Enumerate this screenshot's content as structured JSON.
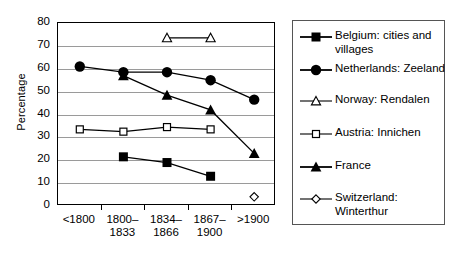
{
  "chart_data": {
    "type": "line",
    "title": "",
    "xlabel": "",
    "ylabel": "Percentage",
    "ylim": [
      0,
      80
    ],
    "ytick_step": 10,
    "yticks": [
      80,
      70,
      60,
      50,
      40,
      30,
      20,
      10,
      0
    ],
    "grid": true,
    "legend_position": "right",
    "categories": [
      "<1800",
      "1800–\n1833",
      "1834–\n1866",
      "1867–\n1900",
      ">1900"
    ],
    "categories_flat": [
      "<1800",
      "1800-1833",
      "1834-1866",
      "1867-1900",
      ">1900"
    ],
    "series": [
      {
        "name": "Belgium: cities and villages",
        "marker": "filled-square",
        "values": [
          null,
          21.5,
          19.0,
          13.0,
          null
        ]
      },
      {
        "name": "Netherlands: Zeeland",
        "marker": "filled-circle",
        "values": [
          61.0,
          58.5,
          58.5,
          55.0,
          46.5
        ]
      },
      {
        "name": "Norway: Rendalen",
        "marker": "open-triangle",
        "values": [
          null,
          null,
          73.5,
          73.5,
          null
        ]
      },
      {
        "name": "Austria: Innichen",
        "marker": "open-square",
        "values": [
          33.5,
          32.5,
          34.5,
          33.5,
          null
        ]
      },
      {
        "name": "France",
        "marker": "filled-triangle",
        "values": [
          null,
          57.0,
          48.5,
          42.0,
          23.0
        ]
      },
      {
        "name": "Switzerland: Winterthur",
        "marker": "open-diamond",
        "values": [
          null,
          null,
          null,
          null,
          4.0
        ]
      }
    ]
  },
  "legend": {
    "items": [
      {
        "label": "Belgium: cities and\nvillages",
        "marker": "filled-square"
      },
      {
        "label": "Netherlands: Zeeland",
        "marker": "filled-circle"
      },
      {
        "label": "Norway: Rendalen",
        "marker": "open-triangle"
      },
      {
        "label": "Austria: Innichen",
        "marker": "open-square"
      },
      {
        "label": "France",
        "marker": "filled-triangle"
      },
      {
        "label": "Switzerland:\nWinterthur",
        "marker": "open-diamond"
      }
    ]
  },
  "colors": {
    "ink": "#000000",
    "gridline": "#9a9a9a",
    "background": "#ffffff"
  }
}
